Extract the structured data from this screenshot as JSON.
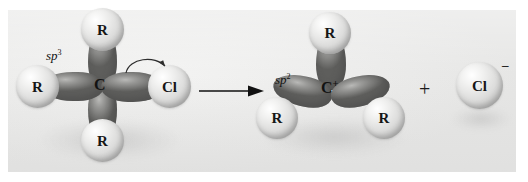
{
  "figure": {
    "type": "reaction-scheme"
  },
  "reactant": {
    "name": "sp3-alkyl-chloride",
    "hybridization_label": "sp",
    "hybridization_superscript": "3",
    "center_atom": "C",
    "center_charge": "",
    "substituents": [
      {
        "position": "top",
        "label": "R"
      },
      {
        "position": "left",
        "label": "R"
      },
      {
        "position": "bottom",
        "label": "R"
      },
      {
        "position": "right",
        "label": "Cl"
      }
    ],
    "curved_arrow": "electron-pair-shift-to-chlorine"
  },
  "reaction_arrow": {
    "name": "forward-reaction-arrow",
    "direction": "right"
  },
  "plus_sign": "+",
  "product_cation": {
    "name": "sp2-carbocation",
    "hybridization_label": "sp",
    "hybridization_superscript": "2",
    "center_atom": "C",
    "center_charge": "+",
    "substituents": [
      {
        "position": "top",
        "label": "R"
      },
      {
        "position": "bottom-left",
        "label": "R"
      },
      {
        "position": "bottom-right",
        "label": "R"
      }
    ]
  },
  "product_anion": {
    "name": "chloride-ion",
    "label": "Cl",
    "charge": "–"
  },
  "colors": {
    "background": "#ffffff",
    "panel": "#ececeb",
    "sphere_light": "#f2f2f1",
    "lobe_dark": "#7e7e7c",
    "text": "#121212"
  }
}
